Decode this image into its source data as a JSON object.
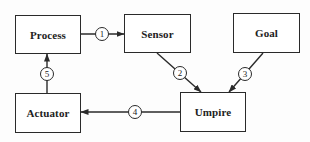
{
  "diagram": {
    "type": "block-diagram",
    "colors": {
      "stroke": "#2a2a2a",
      "text": "#222222",
      "background": "#ffffff"
    },
    "nodes": [
      {
        "id": "process",
        "label": "Process"
      },
      {
        "id": "sensor",
        "label": "Sensor"
      },
      {
        "id": "goal",
        "label": "Goal"
      },
      {
        "id": "actuator",
        "label": "Actuator"
      },
      {
        "id": "umpire",
        "label": "Umpire"
      }
    ],
    "edges": [
      {
        "number": "1",
        "from": "process",
        "to": "sensor"
      },
      {
        "number": "2",
        "from": "sensor",
        "to": "umpire"
      },
      {
        "number": "3",
        "from": "goal",
        "to": "umpire"
      },
      {
        "number": "4",
        "from": "umpire",
        "to": "actuator"
      },
      {
        "number": "5",
        "from": "actuator",
        "to": "process"
      }
    ]
  }
}
